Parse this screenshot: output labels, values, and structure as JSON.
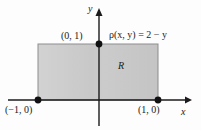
{
  "figure": {
    "title_alt": "Shaded rectangular lamina R in the xy-plane with density function",
    "background_color": "#fdfdfd",
    "ink_color": "#1b1b1b",
    "fill_color": "#c9c9c9",
    "fill_color_light": "#d6d6d6",
    "edge_color": "#7a7a7a"
  },
  "axes": {
    "x_label": "x",
    "y_label": "y",
    "x_axis": {
      "start_px": 8,
      "end_px": 190,
      "y_px": 100
    },
    "y_axis": {
      "top_px": 12,
      "bottom_px": 126,
      "x_px": 99
    }
  },
  "labels": {
    "vertex_top": "(0, 1)",
    "vertex_left": "(−1, 0)",
    "vertex_right": "(1, 0)",
    "region": "R",
    "density": "ρ(x, y) = 2 − y"
  },
  "points": [
    {
      "name": "vertex-top-point",
      "label": "(0, 1)",
      "x": 0,
      "y": 1
    },
    {
      "name": "vertex-left-point",
      "label": "(−1, 0)",
      "x": -1,
      "y": 0
    },
    {
      "name": "vertex-right-point",
      "label": "(1, 0)",
      "x": 1,
      "y": 0
    }
  ],
  "region": {
    "name": "R",
    "shape": "rectangle",
    "x_min": -1,
    "x_max": 1,
    "y_min": 0,
    "y_max": 1,
    "density_function": "ρ(x, y) = 2 − y",
    "pixels": {
      "left": 38,
      "top": 44,
      "right": 158,
      "bottom": 100
    }
  }
}
